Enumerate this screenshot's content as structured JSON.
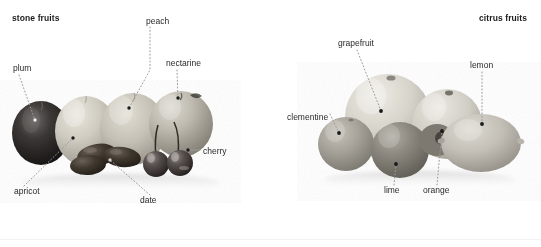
{
  "figure": {
    "type": "annotated-photograph",
    "background_color": "#ffffff",
    "groups": [
      {
        "id": "stone-fruits",
        "title": "stone fruits",
        "title_pos": {
          "x": 12,
          "y": 18
        },
        "title_bold": true,
        "labels": [
          {
            "name": "peach",
            "text": "peach",
            "x": 146,
            "y": 22,
            "anchor": "start",
            "dot": {
              "x": 129,
              "y": 108
            }
          },
          {
            "name": "nectarine",
            "text": "nectarine",
            "x": 166,
            "y": 64,
            "anchor": "start",
            "dot": {
              "x": 178,
              "y": 98
            }
          },
          {
            "name": "plum",
            "text": "plum",
            "x": 13,
            "y": 69,
            "anchor": "start",
            "dot": {
              "x": 35,
              "y": 120
            }
          },
          {
            "name": "cherry",
            "text": "cherry",
            "x": 203,
            "y": 152,
            "anchor": "start",
            "dot": {
              "x": 188,
              "y": 150
            }
          },
          {
            "name": "apricot",
            "text": "apricot",
            "x": 14,
            "y": 192,
            "anchor": "start",
            "dot": {
              "x": 73,
              "y": 138
            }
          },
          {
            "name": "date",
            "text": "date",
            "x": 144,
            "y": 200,
            "anchor": "start",
            "dot": {
              "x": 110,
              "y": 160
            }
          }
        ]
      },
      {
        "id": "citrus-fruits",
        "title": "citrus fruits",
        "title_pos": {
          "x": 479,
          "y": 18
        },
        "title_bold": true,
        "labels": [
          {
            "name": "grapefruit",
            "text": "grapefruit",
            "x": 338,
            "y": 44,
            "anchor": "start",
            "dot": {
              "x": 381,
              "y": 111
            }
          },
          {
            "name": "lemon",
            "text": "lemon",
            "x": 471,
            "y": 66,
            "anchor": "start",
            "dot": {
              "x": 482,
              "y": 124
            }
          },
          {
            "name": "clementine",
            "text": "clementine",
            "x": 288,
            "y": 118,
            "anchor": "start",
            "dot": {
              "x": 339,
              "y": 133
            }
          },
          {
            "name": "lime",
            "text": "lime",
            "x": 385,
            "y": 190,
            "anchor": "start",
            "dot": {
              "x": 396,
              "y": 164
            }
          },
          {
            "name": "orange",
            "text": "orange",
            "x": 425,
            "y": 190,
            "anchor": "start",
            "dot": {
              "x": 442,
              "y": 131
            }
          }
        ]
      }
    ]
  },
  "colors": {
    "label_text": "#2a2a2a",
    "title_text": "#1b1b1b",
    "leader_line": "#9a9a9a",
    "background": "#ffffff",
    "baseline_rule": "#f2f2f2"
  }
}
